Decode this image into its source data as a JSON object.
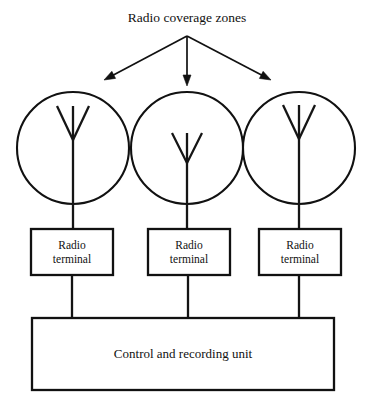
{
  "canvas": {
    "width": 371,
    "height": 409,
    "background": "#ffffff",
    "ink_color": "#111111"
  },
  "title": {
    "label": "Radio coverage zones",
    "x": 187,
    "y": 22
  },
  "pointer_arrows": {
    "origin_x": 187,
    "origin_y": 36,
    "targets": [
      {
        "name": "arrow-to-left-zone",
        "x": 104,
        "y": 80
      },
      {
        "name": "arrow-to-center-zone",
        "x": 187,
        "y": 86
      },
      {
        "name": "arrow-to-right-zone",
        "x": 271,
        "y": 80
      }
    ]
  },
  "coverage_zones": [
    {
      "name": "left-coverage-zone",
      "cx": 73,
      "cy": 148,
      "r": 56
    },
    {
      "name": "center-coverage-zone",
      "cx": 187,
      "cy": 148,
      "r": 56
    },
    {
      "name": "right-coverage-zone",
      "cx": 299,
      "cy": 148,
      "r": 56
    }
  ],
  "antennas": [
    {
      "name": "left-antenna",
      "mast_x": 73,
      "mast_top": 106,
      "mast_bottom": 229,
      "fork_top_y": 106,
      "fork_join_y": 140,
      "fork_half_width": 16
    },
    {
      "name": "center-antenna",
      "mast_x": 187,
      "mast_top": 133,
      "mast_bottom": 229,
      "fork_top_y": 133,
      "fork_join_y": 163,
      "fork_half_width": 15
    },
    {
      "name": "right-antenna",
      "mast_x": 299,
      "mast_top": 105,
      "mast_bottom": 229,
      "fork_top_y": 105,
      "fork_join_y": 139,
      "fork_half_width": 16
    }
  ],
  "terminal_boxes": [
    {
      "name": "radio-terminal-left",
      "line1": "Radio",
      "line2": "terminal",
      "x": 31,
      "y": 229,
      "width": 82,
      "height": 46
    },
    {
      "name": "radio-terminal-center",
      "line1": "Radio",
      "line2": "terminal",
      "x": 148,
      "y": 229,
      "width": 82,
      "height": 46
    },
    {
      "name": "radio-terminal-right",
      "line1": "Radio",
      "line2": "terminal",
      "x": 259,
      "y": 229,
      "width": 82,
      "height": 46
    }
  ],
  "terminal_connectors": [
    {
      "name": "connector-left",
      "x": 72,
      "y1": 275,
      "y2": 318
    },
    {
      "name": "connector-center",
      "x": 188,
      "y1": 275,
      "y2": 318
    },
    {
      "name": "connector-right",
      "x": 299,
      "y1": 275,
      "y2": 318
    }
  ],
  "control_unit": {
    "name": "control-and-recording-unit",
    "label": "Control and recording unit",
    "x": 32,
    "y": 318,
    "width": 302,
    "height": 72,
    "label_x": 183,
    "label_y": 358
  }
}
